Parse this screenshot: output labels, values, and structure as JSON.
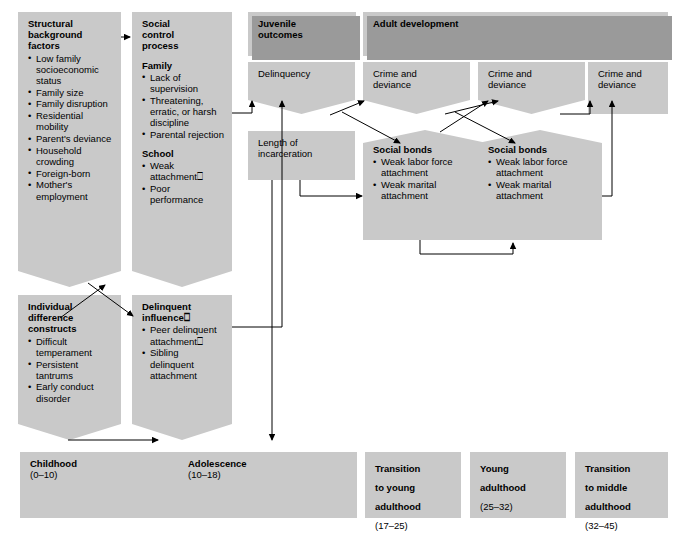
{
  "diagram": {
    "title_columns": [
      {
        "id": "juvenile",
        "label": "Juvenile\noutcomes"
      },
      {
        "id": "adult",
        "label": "Adult  development"
      }
    ],
    "boxes": {
      "structural": {
        "heading": "Structural\nbackground\nfactors",
        "items": [
          "Low family socioeconomic status",
          "Family size",
          "Family disruption",
          "Residential mobility",
          "Parent's deviance",
          "Household crowding",
          "Foreign-born",
          "Mother's employment"
        ]
      },
      "social_control": {
        "heading": "Social\ncontrol\nprocess",
        "sections": [
          {
            "label": "Family",
            "items": [
              "Lack of supervision",
              "Threatening, erratic, or harsh discipline",
              "Parental rejection"
            ]
          },
          {
            "label": "School",
            "items": [
              "Weak attachment⎕",
              "Poor performance"
            ]
          }
        ]
      },
      "individual": {
        "heading": "Individual\ndifference\nconstructs",
        "items": [
          "Difficult temperament",
          "Persistent tantrums",
          "Early conduct disorder"
        ]
      },
      "delinquent_influence": {
        "heading": "Delinquent\ninfluence⎕",
        "items": [
          "Peer delinquent attachment⎕",
          "Sibling delinquent attachment"
        ]
      },
      "delinquency": {
        "label": "Delinquency"
      },
      "incarceration": {
        "label": "Length of\nincarceration"
      },
      "crime1": {
        "label": "Crime and\ndeviance"
      },
      "crime2": {
        "label": "Crime and\ndeviance"
      },
      "crime3": {
        "label": "Crime and\ndeviance"
      },
      "bonds1": {
        "heading": "Social bonds",
        "items": [
          "Weak labor force attachment",
          "Weak marital attachment"
        ]
      },
      "bonds2": {
        "heading": "Social bonds",
        "items": [
          "Weak labor force attachment",
          "Weak marital attachment"
        ]
      }
    },
    "timeline": [
      {
        "id": "childhood",
        "label": "Childhood",
        "range": "(0–10)"
      },
      {
        "id": "adolescence",
        "label": "Adolescence",
        "range": "(10–18)"
      },
      {
        "id": "trans-young",
        "label": "Transition\nto young\nadulthood",
        "range": "(17–25)"
      },
      {
        "id": "young-adult",
        "label": "Young\nadulthood",
        "range": "(25–32)"
      },
      {
        "id": "trans-middle",
        "label": "Transition\nto middle\nadulthood",
        "range": "(32–45)"
      }
    ],
    "colors": {
      "fill": "#c9c9c9",
      "shadow": "#9a9a9a",
      "stroke": "#000000",
      "page": "#ffffff"
    }
  }
}
